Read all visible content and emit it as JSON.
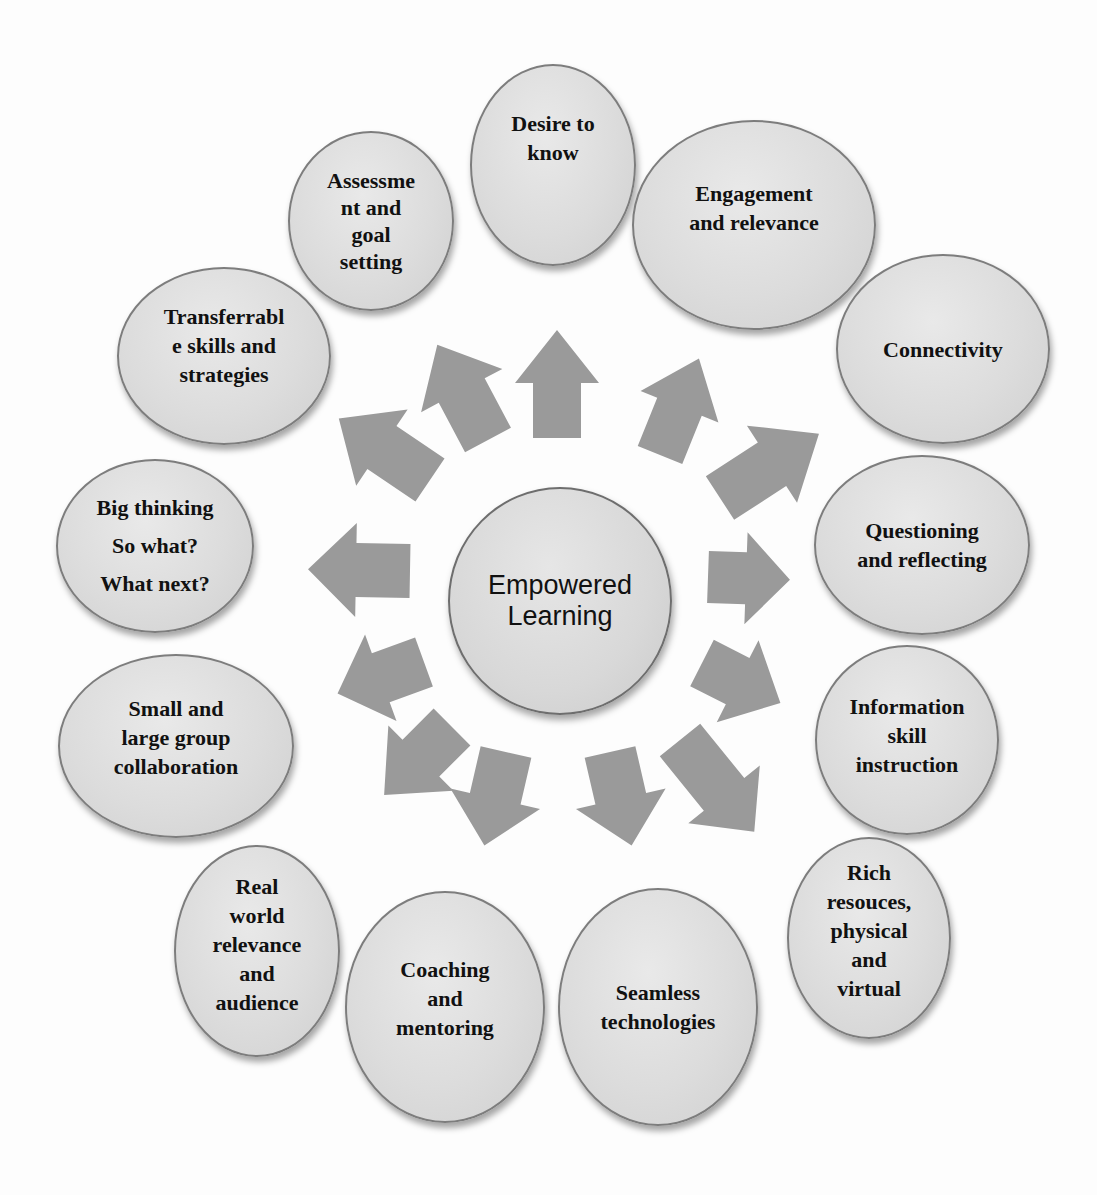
{
  "diagram": {
    "type": "radial-hub",
    "center": {
      "label": "Empowered\nLearning"
    },
    "colors": {
      "background": "#fdfdfd",
      "node_fill": "#dcdcdc",
      "node_border": "#7d7d7d",
      "arrow_fill": "#9a9a9a",
      "text": "#111111"
    },
    "nodes": [
      {
        "id": "desire",
        "label": "Desire to\nknow"
      },
      {
        "id": "engagement",
        "label": "Engagement\nand relevance"
      },
      {
        "id": "connectivity",
        "label": "Connectivity"
      },
      {
        "id": "questioning",
        "label": "Questioning\nand reflecting"
      },
      {
        "id": "information",
        "label": "Information\nskill\ninstruction"
      },
      {
        "id": "rich-resources",
        "label": "Rich\nresouces,\nphysical\nand\nvirtual"
      },
      {
        "id": "seamless",
        "label": "Seamless\ntechnologies"
      },
      {
        "id": "coaching",
        "label": "Coaching\nand\nmentoring"
      },
      {
        "id": "real-world",
        "label": "Real\nworld\nrelevance\nand\naudience"
      },
      {
        "id": "collaboration",
        "label": "Small and\nlarge group\ncollaboration"
      },
      {
        "id": "big-thinking",
        "label": "Big thinking\nSo what?\nWhat next?"
      },
      {
        "id": "transferrable",
        "label": "Transferrabl\ne skills and\nstrategies"
      },
      {
        "id": "assessment",
        "label": "Assessme\nnt and\ngoal\nsetting"
      }
    ],
    "arrow_count": 14,
    "arrow_direction": "outward from center"
  }
}
